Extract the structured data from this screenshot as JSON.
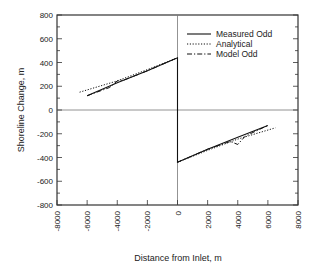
{
  "chart_data": {
    "type": "line",
    "title": "",
    "xlabel": "Distance from Inlet, m",
    "ylabel": "Shoreline Change, m",
    "xlim": [
      -8000,
      8000
    ],
    "ylim": [
      -800,
      800
    ],
    "x_ticks": [
      "-8000",
      "-6000",
      "-4000",
      "-2000",
      "0",
      "2000",
      "4000",
      "6000",
      "8000"
    ],
    "y_ticks": [
      "800",
      "600",
      "400",
      "200",
      "0",
      "-200",
      "-400",
      "-600",
      "-800"
    ],
    "grid": false,
    "zero_lines": true,
    "legend_position": "upper right",
    "legend": [
      "Measured Odd",
      "Analytical",
      "Model Odd"
    ],
    "series": [
      {
        "name": "Measured Odd",
        "style": "solid",
        "x": [
          -6000,
          -4000,
          -2000,
          0,
          0,
          2000,
          4000,
          6000
        ],
        "y": [
          120,
          230,
          330,
          440,
          -440,
          -330,
          -230,
          -130
        ]
      },
      {
        "name": "Analytical",
        "style": "dotted",
        "x": [
          -6500,
          -4000,
          -2000,
          0,
          0,
          2000,
          4000,
          6500
        ],
        "y": [
          150,
          245,
          340,
          440,
          -440,
          -340,
          -245,
          -150
        ]
      },
      {
        "name": "Model Odd",
        "style": "dashdot",
        "x": [
          -6000,
          -4500,
          -4000,
          -3500,
          -2000,
          0,
          0,
          2000,
          3500,
          4000,
          4500,
          6000
        ],
        "y": [
          120,
          190,
          245,
          255,
          330,
          440,
          -440,
          -330,
          -265,
          -290,
          -220,
          -130
        ]
      }
    ]
  }
}
